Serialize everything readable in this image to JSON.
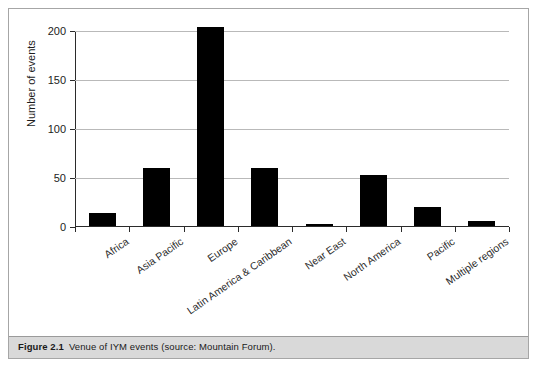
{
  "caption": {
    "figure_number": "Figure 2.1",
    "text": "Venue of IYM events (source: Mountain Forum)."
  },
  "chart_data": {
    "type": "bar",
    "title": "",
    "xlabel": "",
    "ylabel": "Number of events",
    "ylim": [
      0,
      200
    ],
    "yticks": [
      0,
      50,
      100,
      150,
      200
    ],
    "ytick_labels": [
      "0",
      "50",
      "100",
      "150",
      "200"
    ],
    "grid": true,
    "legend": false,
    "bar_color": "#000000",
    "categories": [
      "Africa",
      "Asia Pacific",
      "Europe",
      "Latin America & Caribbean",
      "Near East",
      "North America",
      "Pacific",
      "Multiple regions"
    ],
    "values": [
      13,
      59,
      203,
      59,
      2,
      52,
      19,
      5
    ]
  }
}
